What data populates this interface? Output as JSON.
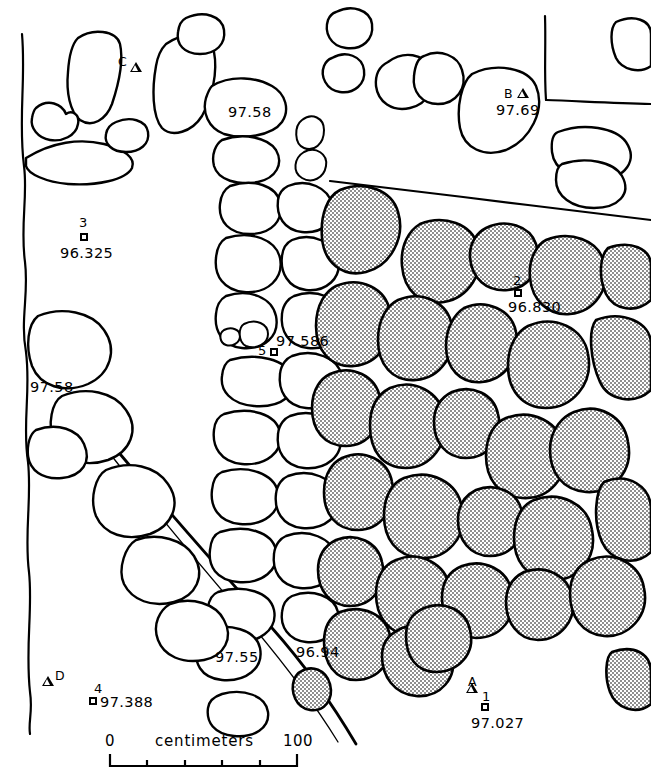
{
  "figure": {
    "kind": "archaeological-site-plan"
  },
  "scale_bar": {
    "start_label": "0",
    "end_label": "100",
    "caption": "centimeters",
    "divisions": 5
  },
  "elevation_labels": [
    {
      "id": "elev-top-center",
      "text": "97.58",
      "x": 228,
      "y": 105
    },
    {
      "id": "elev-mid-left",
      "text": "97.58",
      "x": 30,
      "y": 380
    },
    {
      "id": "elev-lower-mid",
      "text": "97.55",
      "x": 215,
      "y": 650
    },
    {
      "id": "elev-lower-right",
      "text": "96.94",
      "x": 296,
      "y": 645
    }
  ],
  "datum_points": [
    {
      "id": "dp-3",
      "number": "3",
      "elevation": "96.325",
      "marker": "square",
      "num_x": 79,
      "num_y": 216,
      "sq_x": 80,
      "sq_y": 233,
      "el_x": 60,
      "el_y": 246
    },
    {
      "id": "dp-5",
      "number": "5",
      "elevation": "97.586",
      "marker": "square",
      "num_x": 258,
      "num_y": 344,
      "sq_x": 270,
      "sq_y": 348,
      "el_x": 276,
      "el_y": 334
    },
    {
      "id": "dp-2",
      "number": "2",
      "elevation": "96.830",
      "marker": "square",
      "num_x": 513,
      "num_y": 274,
      "sq_x": 514,
      "sq_y": 289,
      "el_x": 508,
      "el_y": 300
    },
    {
      "id": "dp-4",
      "number": "4",
      "elevation": "97.388",
      "marker": "square",
      "num_x": 94,
      "num_y": 682,
      "sq_x": 89,
      "sq_y": 697,
      "el_x": 100,
      "el_y": 695
    },
    {
      "id": "dp-1",
      "number": "1",
      "elevation": "97.027",
      "marker": "square",
      "num_x": 482,
      "num_y": 690,
      "sq_x": 481,
      "sq_y": 703,
      "el_x": 471,
      "el_y": 716
    }
  ],
  "benchmarks": [
    {
      "id": "bm-C",
      "letter": "C",
      "elevation": null,
      "ltr_x": 118,
      "ltr_y": 56,
      "tri_x": 130,
      "tri_y": 62
    },
    {
      "id": "bm-B",
      "letter": "B",
      "elevation": "97.69",
      "ltr_x": 504,
      "ltr_y": 88,
      "tri_x": 517,
      "tri_y": 88,
      "el_x": 496,
      "el_y": 103
    },
    {
      "id": "bm-D",
      "letter": "D",
      "elevation": null,
      "ltr_x": 55,
      "ltr_y": 670,
      "tri_x": 42,
      "tri_y": 676
    },
    {
      "id": "bm-A",
      "letter": "A",
      "elevation": null,
      "ltr_x": 468,
      "ltr_y": 676,
      "tri_x": 466,
      "tri_y": 683
    }
  ],
  "colors": {
    "ink": "#000000",
    "paper": "#ffffff",
    "stipple": "#9a9a9a"
  }
}
